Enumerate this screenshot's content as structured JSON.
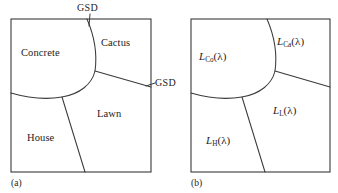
{
  "figure": {
    "background": "#ffffff",
    "line_color": "#3a3a3a",
    "text_color": "#1c1c1c"
  },
  "panel_a": {
    "caption": "(a)",
    "regions": [
      {
        "name": "concrete",
        "label": "Concrete"
      },
      {
        "name": "cactus",
        "label": "Cactus"
      },
      {
        "name": "lawn",
        "label": "Lawn"
      },
      {
        "name": "house",
        "label": "House"
      }
    ],
    "annotations": [
      {
        "name": "gsd-top",
        "label": "GSD"
      },
      {
        "name": "gsd-right",
        "label": "GSD"
      }
    ]
  },
  "panel_b": {
    "caption": "(b)",
    "regions": [
      {
        "name": "concrete",
        "symbol": "L",
        "subscript": "Co",
        "arg": "(λ)"
      },
      {
        "name": "cactus",
        "symbol": "L",
        "subscript": "Ca",
        "arg": "(λ)"
      },
      {
        "name": "lawn",
        "symbol": "L",
        "subscript": "L",
        "arg": "(λ)"
      },
      {
        "name": "house",
        "symbol": "L",
        "subscript": "H",
        "arg": "(λ)"
      }
    ]
  }
}
